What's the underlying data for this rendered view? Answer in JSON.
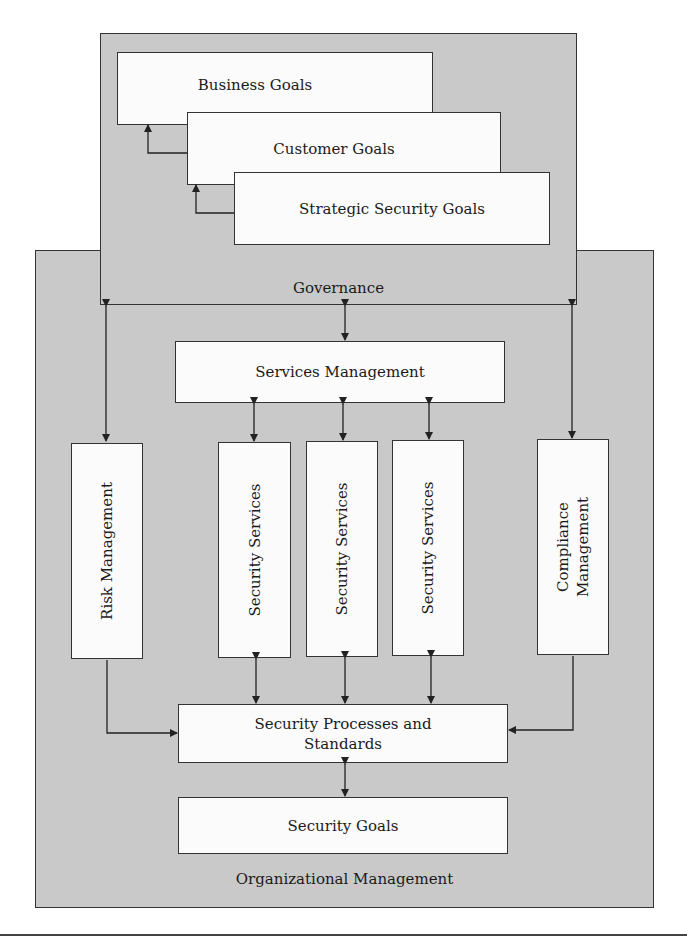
{
  "diagram": {
    "governance": {
      "label": "Governance",
      "goals": [
        {
          "label": "Business Goals"
        },
        {
          "label": "Customer Goals"
        },
        {
          "label": "Strategic Security Goals"
        }
      ]
    },
    "organizational_management": {
      "label": "Organizational Management",
      "services_management": "Services Management",
      "risk_management": "Risk Management",
      "security_services": [
        "Security Services",
        "Security Services",
        "Security Services"
      ],
      "compliance_management": [
        "Compliance",
        "Management"
      ],
      "security_processes": [
        "Security Processes and",
        "Standards"
      ],
      "security_goals": "Security Goals"
    },
    "colors": {
      "panel_fill": "#c9c9c9",
      "box_fill": "#fbfbfb",
      "stroke": "#333333"
    }
  }
}
